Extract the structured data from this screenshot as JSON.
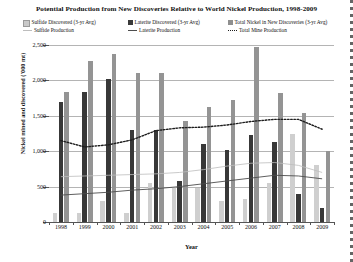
{
  "chart_data": {
    "type": "bar",
    "title": "Potential Production from New Discoveries Relative to World Nickel Production, 1998-2009",
    "xlabel": "Year",
    "ylabel": "Nickel mined and discovered ('000 mt)",
    "categories": [
      "1998",
      "1999",
      "2000",
      "2001",
      "2002",
      "2003",
      "2004",
      "2005",
      "2006",
      "2007",
      "2008",
      "2009"
    ],
    "ylim": [
      0,
      2500
    ],
    "yticks": [
      "0",
      "500",
      "1,000",
      "1,500",
      "2,000",
      "2,500"
    ],
    "ytick_values": [
      0,
      500,
      1000,
      1500,
      2000,
      2500
    ],
    "grid": true,
    "legend_position": "top",
    "bar_series": [
      {
        "name": "Sulfide Discovered (3-yr Avg)",
        "color": "#cfcfcf",
        "values": [
          130,
          130,
          300,
          130,
          550,
          500,
          480,
          300,
          330,
          550,
          1250,
          800
        ]
      },
      {
        "name": "Laterite Discovered (3-yr Avg)",
        "color": "#383838",
        "values": [
          1700,
          1830,
          2020,
          1300,
          1300,
          580,
          1100,
          1020,
          1230,
          1130,
          400,
          200
        ]
      },
      {
        "name": "Total Nickel in New Discoveries (3-yr Avg)",
        "color": "#949494",
        "values": [
          1830,
          2280,
          2380,
          2110,
          2110,
          1420,
          1630,
          1720,
          2470,
          1820,
          1540,
          1010
        ]
      }
    ],
    "line_series": [
      {
        "name": "Sulfide Production",
        "color": "#bdbdbd",
        "style": "solid-light",
        "values": [
          640,
          650,
          660,
          670,
          680,
          700,
          740,
          790,
          830,
          840,
          800,
          700
        ]
      },
      {
        "name": "Laterite Production",
        "color": "#4d4d4d",
        "style": "solid-dark",
        "values": [
          380,
          400,
          420,
          450,
          470,
          500,
          540,
          580,
          620,
          660,
          650,
          610
        ]
      },
      {
        "name": "Total Mine Production",
        "color": "#1d1d1d",
        "style": "dotted",
        "values": [
          1150,
          1060,
          1090,
          1160,
          1290,
          1330,
          1340,
          1370,
          1420,
          1450,
          1450,
          1310
        ]
      }
    ]
  },
  "legend": {
    "items": [
      {
        "label": "Sulfide Discovered (3-yr Avg)",
        "marker": "square-light-swatch-icon"
      },
      {
        "label": "Laterite Discovered (3-yr Avg)",
        "marker": "square-dark-swatch-icon"
      },
      {
        "label": "Total Nickel in New Discoveries (3-yr Avg)",
        "marker": "square-gray-swatch-icon"
      },
      {
        "label": "Sulfide Production",
        "marker": "line-light-swatch-icon"
      },
      {
        "label": "Laterite Production",
        "marker": "line-dark-swatch-icon"
      },
      {
        "label": "Total Mine Production",
        "marker": "line-dotted-swatch-icon"
      }
    ]
  }
}
